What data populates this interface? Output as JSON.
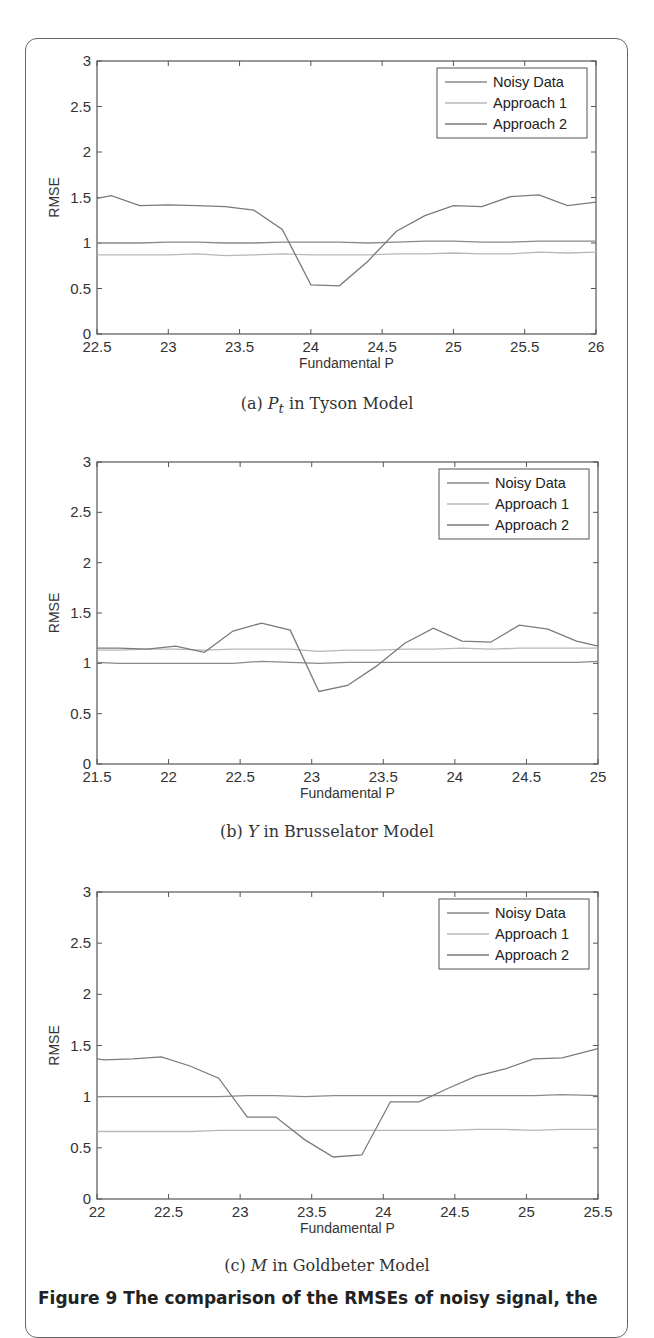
{
  "figure_caption": "Figure 9 The comparison of the RMSEs of noisy signal, the",
  "colors": {
    "noisy": "#8a8a8a",
    "approach1": "#b8b8b8",
    "approach2": "#7a7a7a",
    "axis": "#555555"
  },
  "chart_data": [
    {
      "type": "line",
      "id": "a",
      "caption_prefix": "(a) ",
      "caption_var": "P",
      "caption_sub": "t",
      "caption_suffix": " in Tyson Model",
      "xlabel": "Fundamental P",
      "ylabel": "RMSE",
      "xlim": [
        22.5,
        26
      ],
      "ylim": [
        0,
        3
      ],
      "xticks": [
        "22.5",
        "23",
        "23.5",
        "24",
        "24.5",
        "25",
        "25.5",
        "26"
      ],
      "yticks": [
        "0",
        "0.5",
        "1",
        "1.5",
        "2",
        "2.5",
        "3"
      ],
      "legend": [
        "Noisy Data",
        "Approach 1",
        "Approach 2"
      ],
      "legend_position": "upper right",
      "grid": false,
      "x": [
        22.5,
        22.6,
        22.8,
        23.0,
        23.2,
        23.4,
        23.6,
        23.8,
        24.0,
        24.2,
        24.4,
        24.6,
        24.8,
        25.0,
        25.2,
        25.4,
        25.6,
        25.8,
        26.0
      ],
      "series": [
        {
          "name": "Noisy Data",
          "values": [
            1.0,
            1.0,
            1.0,
            1.01,
            1.01,
            1.0,
            1.0,
            1.01,
            1.01,
            1.01,
            1.0,
            1.01,
            1.02,
            1.02,
            1.01,
            1.01,
            1.02,
            1.02,
            1.02
          ]
        },
        {
          "name": "Approach 1",
          "values": [
            0.87,
            0.87,
            0.87,
            0.87,
            0.88,
            0.86,
            0.87,
            0.88,
            0.87,
            0.87,
            0.87,
            0.88,
            0.88,
            0.89,
            0.88,
            0.88,
            0.9,
            0.89,
            0.9
          ]
        },
        {
          "name": "Approach 2",
          "values": [
            1.49,
            1.52,
            1.41,
            1.42,
            1.41,
            1.4,
            1.36,
            1.15,
            0.54,
            0.53,
            0.8,
            1.13,
            1.3,
            1.41,
            1.4,
            1.51,
            1.53,
            1.41,
            1.45
          ]
        }
      ]
    },
    {
      "type": "line",
      "id": "b",
      "caption_prefix": "(b) ",
      "caption_var": "Y",
      "caption_sub": "",
      "caption_suffix": " in Brusselator Model",
      "xlabel": "Fundamental P",
      "ylabel": "RMSE",
      "xlim": [
        21.5,
        25
      ],
      "ylim": [
        0,
        3
      ],
      "xticks": [
        "21.5",
        "22",
        "22.5",
        "23",
        "23.5",
        "24",
        "24.5",
        "25"
      ],
      "yticks": [
        "0",
        "0.5",
        "1",
        "1.5",
        "2",
        "2.5",
        "3"
      ],
      "legend": [
        "Noisy Data",
        "Approach 1",
        "Approach 2"
      ],
      "legend_position": "upper right",
      "grid": false,
      "x": [
        21.5,
        21.65,
        21.85,
        22.05,
        22.25,
        22.45,
        22.65,
        22.85,
        23.05,
        23.25,
        23.45,
        23.65,
        23.85,
        24.05,
        24.25,
        24.45,
        24.65,
        24.85,
        25.0
      ],
      "series": [
        {
          "name": "Noisy Data",
          "values": [
            1.01,
            1.0,
            1.0,
            1.0,
            1.0,
            1.0,
            1.02,
            1.01,
            1.0,
            1.01,
            1.01,
            1.01,
            1.01,
            1.01,
            1.01,
            1.01,
            1.01,
            1.01,
            1.02
          ]
        },
        {
          "name": "Approach 1",
          "values": [
            1.13,
            1.13,
            1.14,
            1.14,
            1.13,
            1.14,
            1.14,
            1.14,
            1.12,
            1.13,
            1.13,
            1.14,
            1.14,
            1.15,
            1.14,
            1.15,
            1.15,
            1.15,
            1.15
          ]
        },
        {
          "name": "Approach 2",
          "values": [
            1.15,
            1.15,
            1.14,
            1.17,
            1.11,
            1.32,
            1.4,
            1.33,
            0.72,
            0.78,
            0.97,
            1.2,
            1.35,
            1.22,
            1.21,
            1.38,
            1.34,
            1.22,
            1.17
          ]
        }
      ]
    },
    {
      "type": "line",
      "id": "c",
      "caption_prefix": "(c) ",
      "caption_var": "M",
      "caption_sub": "",
      "caption_suffix": " in Goldbeter Model",
      "xlabel": "Fundamental P",
      "ylabel": "RMSE",
      "xlim": [
        22,
        25.5
      ],
      "ylim": [
        0,
        3
      ],
      "xticks": [
        "22",
        "22.5",
        "23",
        "23.5",
        "24",
        "24.5",
        "25",
        "25.5"
      ],
      "yticks": [
        "0",
        "0.5",
        "1",
        "1.5",
        "2",
        "2.5",
        "3"
      ],
      "legend": [
        "Noisy Data",
        "Approach 1",
        "Approach 2"
      ],
      "legend_position": "upper right",
      "grid": false,
      "x": [
        22.0,
        22.05,
        22.25,
        22.45,
        22.65,
        22.85,
        23.05,
        23.25,
        23.45,
        23.65,
        23.85,
        24.05,
        24.25,
        24.45,
        24.65,
        24.85,
        25.05,
        25.25,
        25.5
      ],
      "series": [
        {
          "name": "Noisy Data",
          "values": [
            1.0,
            1.0,
            1.0,
            1.0,
            1.0,
            1.0,
            1.01,
            1.01,
            1.0,
            1.01,
            1.01,
            1.01,
            1.01,
            1.01,
            1.01,
            1.01,
            1.01,
            1.02,
            1.01
          ]
        },
        {
          "name": "Approach 1",
          "values": [
            0.66,
            0.66,
            0.66,
            0.66,
            0.66,
            0.67,
            0.67,
            0.67,
            0.67,
            0.67,
            0.67,
            0.67,
            0.67,
            0.67,
            0.68,
            0.68,
            0.67,
            0.68,
            0.68
          ]
        },
        {
          "name": "Approach 2",
          "values": [
            1.37,
            1.36,
            1.37,
            1.39,
            1.3,
            1.18,
            0.8,
            0.8,
            0.58,
            0.41,
            0.43,
            0.95,
            0.95,
            1.08,
            1.2,
            1.27,
            1.37,
            1.38,
            1.47
          ]
        }
      ]
    }
  ]
}
